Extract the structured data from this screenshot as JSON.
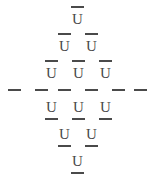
{
  "figure": {
    "title": "",
    "kind": "glyph-lattice",
    "shape": "diamond",
    "glyph": "U",
    "glyph_with_macron": "Ū",
    "ink_color": "#4a4a4a",
    "background_color": "#ffffff",
    "canvas": {
      "width": 155,
      "height": 180
    }
  },
  "rows": [
    {
      "index": 0,
      "bar_position": "above",
      "count": 1,
      "y": 6,
      "cells": [
        {
          "glyph": "U",
          "bar_top": true,
          "bar_bottom": false,
          "x": 69
        }
      ]
    },
    {
      "index": 1,
      "bar_position": "above",
      "count": 2,
      "y": 33,
      "cells": [
        {
          "glyph": "U",
          "bar_top": true,
          "bar_bottom": false,
          "x": 56
        },
        {
          "glyph": "U",
          "bar_top": true,
          "bar_bottom": false,
          "x": 83
        }
      ]
    },
    {
      "index": 2,
      "bar_position": "above",
      "count": 3,
      "y": 60,
      "cells": [
        {
          "glyph": "U",
          "bar_top": true,
          "bar_bottom": false,
          "x": 43
        },
        {
          "glyph": "U",
          "bar_top": true,
          "bar_bottom": false,
          "x": 70
        },
        {
          "glyph": "U",
          "bar_top": true,
          "bar_bottom": false,
          "x": 97
        }
      ]
    },
    {
      "index": 3,
      "bar_position": "center-line",
      "count": 6,
      "y": 89,
      "cells": [
        {
          "glyph": "",
          "bar_top": false,
          "bar_bottom": false,
          "x": 8
        },
        {
          "glyph": "",
          "bar_top": false,
          "bar_bottom": false,
          "x": 35
        },
        {
          "glyph": "",
          "bar_top": false,
          "bar_bottom": false,
          "x": 58
        },
        {
          "glyph": "",
          "bar_top": false,
          "bar_bottom": false,
          "x": 85
        },
        {
          "glyph": "",
          "bar_top": false,
          "bar_bottom": false,
          "x": 112
        },
        {
          "glyph": "",
          "bar_top": false,
          "bar_bottom": false,
          "x": 134
        }
      ]
    },
    {
      "index": 4,
      "bar_position": "below",
      "count": 3,
      "y": 94,
      "cells": [
        {
          "glyph": "U",
          "bar_top": false,
          "bar_bottom": true,
          "x": 43
        },
        {
          "glyph": "U",
          "bar_top": false,
          "bar_bottom": true,
          "x": 70
        },
        {
          "glyph": "U",
          "bar_top": false,
          "bar_bottom": true,
          "x": 97
        }
      ]
    },
    {
      "index": 5,
      "bar_position": "below",
      "count": 2,
      "y": 121,
      "cells": [
        {
          "glyph": "U",
          "bar_top": false,
          "bar_bottom": true,
          "x": 56
        },
        {
          "glyph": "U",
          "bar_top": false,
          "bar_bottom": true,
          "x": 83
        }
      ]
    },
    {
      "index": 6,
      "bar_position": "below",
      "count": 1,
      "y": 148,
      "cells": [
        {
          "glyph": "U",
          "bar_top": false,
          "bar_bottom": true,
          "x": 69
        }
      ]
    }
  ]
}
